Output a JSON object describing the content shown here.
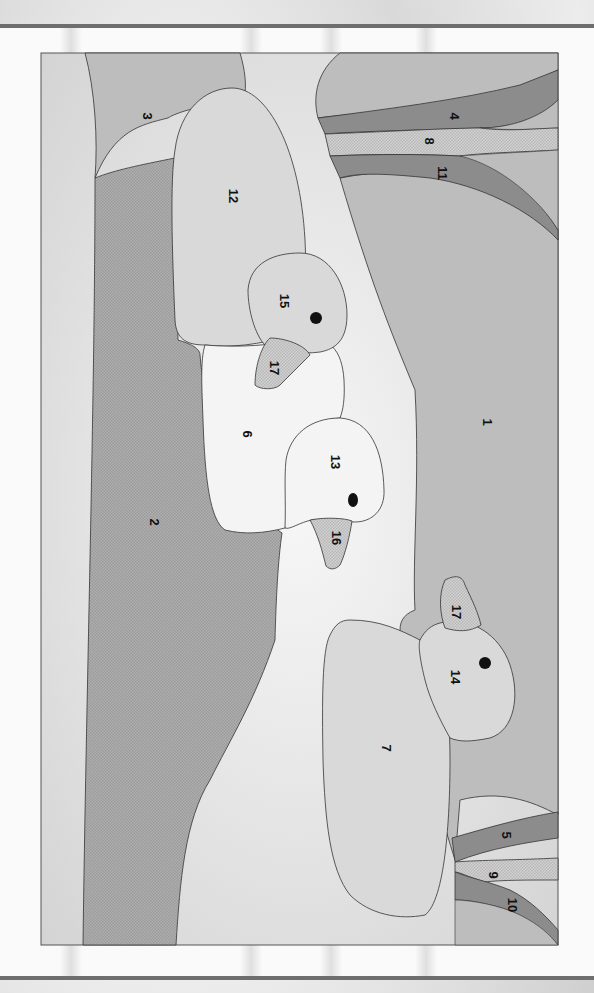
{
  "diagram": {
    "type": "paint-by-number",
    "orientation": "rotated-90-clockwise",
    "colors": {
      "background_clouds": "#e6e6e6",
      "tone_light": "#d9d9d9",
      "tone_medium": "#bdbdbd",
      "tone_dark": "#8c8c8c",
      "tone_white": "#f4f4f4",
      "pattern_check": "#c8c8c8",
      "outline": "#333333"
    },
    "regions": [
      {
        "id": "1",
        "label": "1"
      },
      {
        "id": "2",
        "label": "2"
      },
      {
        "id": "3",
        "label": "3"
      },
      {
        "id": "4",
        "label": "4"
      },
      {
        "id": "5",
        "label": "5"
      },
      {
        "id": "6",
        "label": "6"
      },
      {
        "id": "7",
        "label": "7"
      },
      {
        "id": "8",
        "label": "8"
      },
      {
        "id": "9",
        "label": "9"
      },
      {
        "id": "10",
        "label": "10"
      },
      {
        "id": "11",
        "label": "11"
      },
      {
        "id": "12",
        "label": "12"
      },
      {
        "id": "13",
        "label": "13"
      },
      {
        "id": "14",
        "label": "14"
      },
      {
        "id": "15",
        "label": "15"
      },
      {
        "id": "16",
        "label": "16"
      },
      {
        "id": "17a",
        "label": "17"
      },
      {
        "id": "17b",
        "label": "17"
      }
    ]
  }
}
